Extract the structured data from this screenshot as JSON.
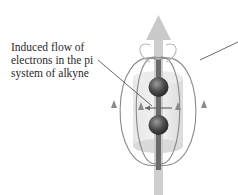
{
  "diagram": {
    "labels": {
      "induced_flow": [
        "Induced flow of",
        "electrons in the pi",
        "system of alkyne"
      ]
    },
    "colors": {
      "field_lines": "#8a8a8a",
      "arrow": "#c8c8c8",
      "cylinder": "#e2e2e2",
      "atom": "#555555",
      "text": "#2a2a2a",
      "leader": "#444444"
    }
  }
}
